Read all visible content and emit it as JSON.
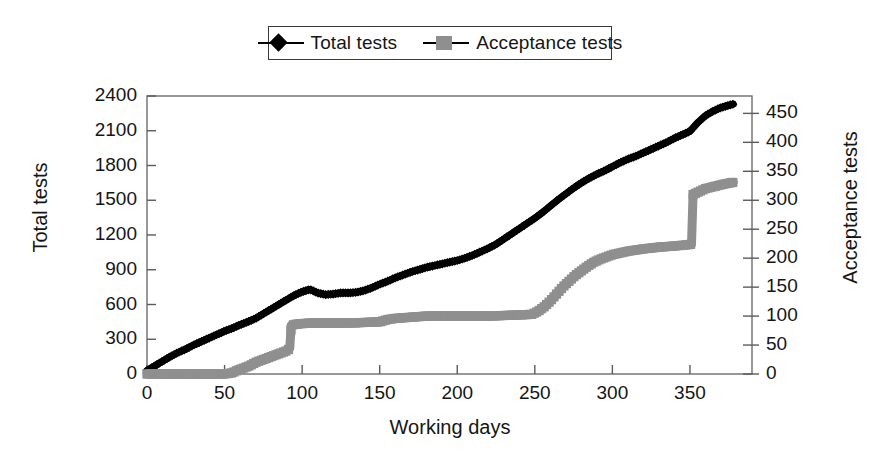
{
  "chart_data": {
    "type": "line",
    "title": "",
    "xlabel": "Working days",
    "ylabel": "Total tests",
    "y2label": "Acceptance tests",
    "grid": false,
    "legend_position": "top-center",
    "xlim": [
      0,
      390
    ],
    "ylim": [
      0,
      2400
    ],
    "y2lim": [
      0,
      480
    ],
    "xticks": [
      0,
      50,
      100,
      150,
      200,
      250,
      300,
      350
    ],
    "yticks": [
      0,
      300,
      600,
      900,
      1200,
      1500,
      1800,
      2100,
      2400
    ],
    "y2ticks": [
      0,
      50,
      100,
      150,
      200,
      250,
      300,
      350,
      400,
      450
    ],
    "series": [
      {
        "name": "Total tests",
        "axis": "left",
        "color": "#000000",
        "marker": "diamond",
        "x": [
          0,
          5,
          10,
          15,
          20,
          25,
          30,
          35,
          40,
          45,
          50,
          55,
          60,
          65,
          70,
          75,
          80,
          85,
          90,
          95,
          100,
          105,
          110,
          115,
          120,
          125,
          130,
          135,
          140,
          145,
          150,
          155,
          160,
          165,
          170,
          175,
          180,
          185,
          190,
          195,
          200,
          205,
          210,
          215,
          220,
          225,
          230,
          235,
          240,
          245,
          250,
          255,
          260,
          265,
          270,
          275,
          280,
          285,
          290,
          295,
          300,
          305,
          310,
          315,
          320,
          325,
          330,
          335,
          340,
          345,
          350,
          355,
          360,
          365,
          370,
          375,
          378
        ],
        "values": [
          30,
          70,
          110,
          150,
          185,
          215,
          250,
          280,
          310,
          340,
          370,
          395,
          425,
          450,
          480,
          520,
          560,
          600,
          640,
          680,
          710,
          730,
          700,
          685,
          690,
          700,
          700,
          705,
          720,
          745,
          775,
          800,
          830,
          855,
          880,
          900,
          920,
          935,
          950,
          965,
          980,
          1000,
          1025,
          1055,
          1085,
          1120,
          1165,
          1210,
          1255,
          1300,
          1345,
          1395,
          1450,
          1505,
          1555,
          1605,
          1650,
          1690,
          1725,
          1755,
          1790,
          1825,
          1855,
          1880,
          1910,
          1940,
          1970,
          2000,
          2035,
          2065,
          2095,
          2170,
          2230,
          2270,
          2300,
          2320,
          2330
        ]
      },
      {
        "name": "Acceptance tests",
        "axis": "right",
        "color": "#8f8f8f",
        "marker": "square",
        "x": [
          0,
          50,
          55,
          58,
          62,
          66,
          70,
          74,
          78,
          82,
          86,
          90,
          92,
          93,
          96,
          100,
          105,
          110,
          120,
          130,
          140,
          150,
          155,
          160,
          165,
          170,
          175,
          180,
          190,
          200,
          210,
          220,
          230,
          240,
          248,
          252,
          256,
          260,
          264,
          268,
          272,
          276,
          280,
          284,
          288,
          292,
          300,
          310,
          320,
          330,
          340,
          348,
          351,
          352,
          356,
          360,
          366,
          372,
          378
        ],
        "values": [
          0,
          0,
          2,
          6,
          10,
          14,
          20,
          24,
          28,
          32,
          36,
          40,
          44,
          84,
          86,
          87,
          88,
          88,
          88,
          88,
          89,
          90,
          94,
          96,
          97,
          98,
          99,
          100,
          100,
          100,
          100,
          100,
          101,
          102,
          103,
          108,
          116,
          126,
          138,
          150,
          160,
          170,
          178,
          186,
          193,
          198,
          206,
          212,
          216,
          219,
          221,
          223,
          224,
          310,
          315,
          320,
          324,
          328,
          331
        ]
      }
    ]
  },
  "legend": {
    "entries": [
      {
        "label": "Total tests",
        "marker": "diamond-marker-icon",
        "color": "#000000"
      },
      {
        "label": "Acceptance tests",
        "marker": "square-marker-icon",
        "color": "#8f8f8f"
      }
    ]
  },
  "axes": {
    "left_title": "Total tests",
    "right_title": "Acceptance tests",
    "bottom_title": "Working days",
    "left_tick_labels": [
      "0",
      "300",
      "600",
      "900",
      "1200",
      "1500",
      "1800",
      "2100",
      "2400"
    ],
    "right_tick_labels": [
      "0",
      "50",
      "100",
      "150",
      "200",
      "250",
      "300",
      "350",
      "400",
      "450"
    ],
    "bottom_tick_labels": [
      "0",
      "50",
      "100",
      "150",
      "200",
      "250",
      "300",
      "350"
    ]
  }
}
